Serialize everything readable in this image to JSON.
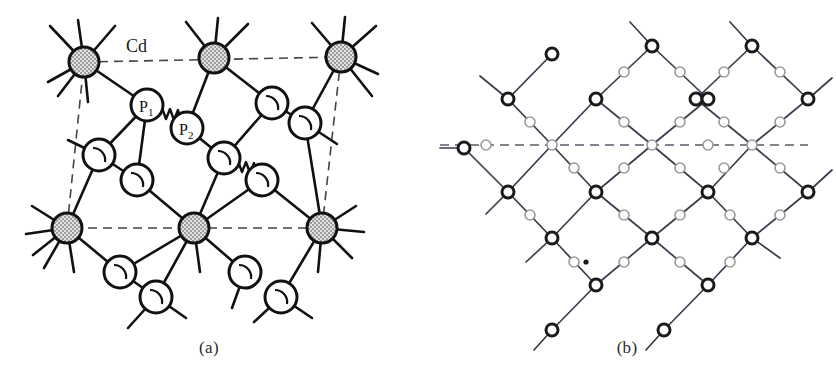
{
  "figure": {
    "background_color": "#ffffff",
    "ink_color": "#1a1a1a"
  },
  "panels": [
    {
      "id": "a",
      "caption": "(a)",
      "description": "Atomic arrangement showing Cd and P atoms with unit cell outline",
      "labels": [
        {
          "name": "cd-label",
          "text": "Cd",
          "x": 126,
          "y": 52
        },
        {
          "name": "p1-label",
          "text": "P",
          "sub": "1",
          "x": 139,
          "y": 108
        },
        {
          "name": "p2-label",
          "text": "P",
          "sub": "2",
          "x": 181,
          "y": 130
        }
      ],
      "atom_styles": {
        "cd": {
          "fill": "#c9c9c9",
          "stroke": "#111111",
          "radius": 15,
          "stroke_width": 3
        },
        "p": {
          "fill": "#ffffff",
          "stroke": "#111111",
          "radius": 16,
          "stroke_width": 3
        }
      },
      "cd_atoms": [
        {
          "name": "cd-top-left",
          "x": 84,
          "y": 62
        },
        {
          "name": "cd-top-mid",
          "x": 214,
          "y": 58
        },
        {
          "name": "cd-top-right",
          "x": 341,
          "y": 57
        },
        {
          "name": "cd-bottom-left",
          "x": 67,
          "y": 228
        },
        {
          "name": "cd-bottom-mid",
          "x": 194,
          "y": 228
        },
        {
          "name": "cd-bottom-right",
          "x": 322,
          "y": 228
        }
      ],
      "p_atoms": [
        {
          "name": "p-atom-p1",
          "x": 147,
          "y": 105,
          "label": "P1"
        },
        {
          "name": "p-atom-p2",
          "x": 187,
          "y": 128,
          "label": "P2"
        },
        {
          "name": "p-atom-upper-right",
          "x": 272,
          "y": 103
        },
        {
          "name": "p-atom-right-upper",
          "x": 305,
          "y": 123
        },
        {
          "name": "p-atom-left-mid",
          "x": 99,
          "y": 155
        },
        {
          "name": "p-atom-mid-lower",
          "x": 137,
          "y": 180
        },
        {
          "name": "p-atom-center-right",
          "x": 224,
          "y": 158
        },
        {
          "name": "p-atom-right-lower",
          "x": 262,
          "y": 180
        },
        {
          "name": "p-atom-bottom-a",
          "x": 120,
          "y": 272
        },
        {
          "name": "p-atom-bottom-b",
          "x": 156,
          "y": 297
        },
        {
          "name": "p-atom-bottom-c",
          "x": 245,
          "y": 272
        },
        {
          "name": "p-atom-bottom-d",
          "x": 281,
          "y": 297
        }
      ],
      "unit_cell": {
        "name": "unit-cell-dashed-parallelogram",
        "style": "dashed",
        "vertices": [
          {
            "x": 84,
            "y": 62
          },
          {
            "x": 341,
            "y": 57
          },
          {
            "x": 322,
            "y": 228
          },
          {
            "x": 67,
            "y": 228
          }
        ]
      },
      "zigzag_bonds": [
        {
          "name": "zigzag-bond-p1-p2",
          "from": {
            "x": 161,
            "y": 113
          },
          "to": {
            "x": 175,
            "y": 121
          }
        },
        {
          "name": "zigzag-bond-right",
          "from": {
            "x": 237,
            "y": 166
          },
          "to": {
            "x": 250,
            "y": 174
          }
        }
      ]
    },
    {
      "id": "b",
      "caption": "(b)",
      "description": "Schematic diamond lattice network of bonds with large and small sites",
      "node_styles": {
        "vertex": {
          "fill": "#ffffff",
          "stroke": "#1a1a1a",
          "radius": 6,
          "stroke_width": 3
        },
        "midpoint": {
          "fill": "#ffffff",
          "stroke": "#9a9a9a",
          "radius": 5,
          "stroke_width": 1.6
        }
      },
      "mirror_line": {
        "name": "mirror-plane-dashed-line",
        "style": "dashed",
        "y": 145,
        "x_start": 22,
        "x_end": 390
      },
      "marker_dot": {
        "name": "origin-dot-marker",
        "x": 168,
        "y": 262,
        "radius": 2.6
      }
    }
  ]
}
